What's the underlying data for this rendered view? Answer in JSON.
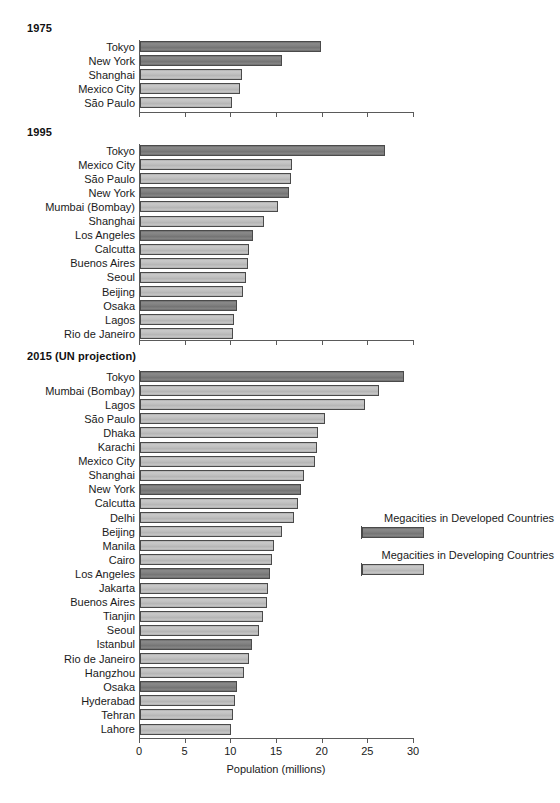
{
  "chart_data": {
    "type": "bar",
    "title": "",
    "xlabel": "Population (millions)",
    "ylabel": "",
    "xlim": [
      0,
      30
    ],
    "xticks": [
      0,
      5,
      10,
      15,
      20,
      25,
      30
    ],
    "xtick_labels": [
      "0",
      "5",
      "10",
      "15",
      "20",
      "25",
      "30"
    ],
    "grid": false,
    "orientation": "horizontal",
    "legend_position": "right",
    "legend": [
      {
        "name": "Megacities in Developed Countries",
        "key": "developed",
        "color": "#7f7f7f"
      },
      {
        "name": "Megacities in Developing Countries",
        "key": "developing",
        "color": "#bfbfbf"
      }
    ],
    "panels": [
      {
        "title": "1975",
        "categories": [
          "Tokyo",
          "New York",
          "Shanghai",
          "Mexico City",
          "São Paulo"
        ],
        "values": [
          19.8,
          15.6,
          11.2,
          10.9,
          10.1
        ],
        "groups": [
          "developed",
          "developed",
          "developing",
          "developing",
          "developing"
        ]
      },
      {
        "title": "1995",
        "categories": [
          "Tokyo",
          "Mexico City",
          "São Paulo",
          "New York",
          "Mumbai (Bombay)",
          "Shanghai",
          "Los Angeles",
          "Calcutta",
          "Buenos Aires",
          "Seoul",
          "Beijing",
          "Osaka",
          "Lagos",
          "Rio de Janeiro"
        ],
        "values": [
          26.8,
          16.6,
          16.5,
          16.3,
          15.1,
          13.6,
          12.4,
          11.9,
          11.8,
          11.6,
          11.3,
          10.6,
          10.3,
          10.2
        ],
        "groups": [
          "developed",
          "developing",
          "developing",
          "developed",
          "developing",
          "developing",
          "developed",
          "developing",
          "developing",
          "developing",
          "developing",
          "developed",
          "developing",
          "developing"
        ]
      },
      {
        "title": "2015 (UN projection)",
        "categories": [
          "Tokyo",
          "Mumbai (Bombay)",
          "Lagos",
          "São Paulo",
          "Dhaka",
          "Karachi",
          "Mexico City",
          "Shanghai",
          "New York",
          "Calcutta",
          "Delhi",
          "Beijing",
          "Manila",
          "Cairo",
          "Los Angeles",
          "Jakarta",
          "Buenos Aires",
          "Tianjin",
          "Seoul",
          "Istanbul",
          "Rio de Janeiro",
          "Hangzhou",
          "Osaka",
          "Hyderabad",
          "Tehran",
          "Lahore"
        ],
        "values": [
          28.9,
          26.2,
          24.6,
          20.3,
          19.5,
          19.4,
          19.2,
          18.0,
          17.6,
          17.3,
          16.9,
          15.6,
          14.7,
          14.4,
          14.2,
          14.0,
          13.9,
          13.5,
          13.0,
          12.3,
          11.9,
          11.4,
          10.6,
          10.4,
          10.2,
          10.0
        ],
        "groups": [
          "developed",
          "developing",
          "developing",
          "developing",
          "developing",
          "developing",
          "developing",
          "developing",
          "developed",
          "developing",
          "developing",
          "developing",
          "developing",
          "developing",
          "developed",
          "developing",
          "developing",
          "developing",
          "developing",
          "developed",
          "developing",
          "developing",
          "developed",
          "developing",
          "developing",
          "developing"
        ]
      }
    ]
  }
}
